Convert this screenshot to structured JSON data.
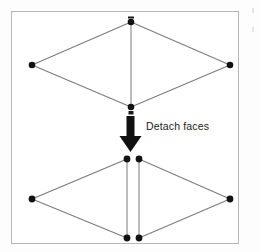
{
  "figure": {
    "background_color": "#ffffff",
    "frame_color": "#b6b6b6",
    "edge_color": "#7d7d7d",
    "vertex_color": "#121212",
    "arrow_color": "#111111",
    "label_color": "#1b1b1b",
    "annotation": {
      "text": "Detach faces",
      "x": 146,
      "y": 120,
      "font_size_px": 10.5
    },
    "arrow": {
      "name": "down-arrow",
      "shaft_x": 130,
      "shaft_top_y": 114,
      "shaft_bottom_y": 134,
      "shaft_width": 7,
      "head_half_width": 11,
      "head_tip_y": 152
    },
    "before": {
      "caption": "Joined mesh: two triangular faces share one interior edge",
      "vertices": [
        {
          "id": "top",
          "name": "vertex-top",
          "x": 131,
          "y": 22
        },
        {
          "id": "left",
          "name": "vertex-left",
          "x": 32,
          "y": 65
        },
        {
          "id": "right",
          "name": "vertex-right",
          "x": 230,
          "y": 65
        },
        {
          "id": "bottom",
          "name": "vertex-bottom",
          "x": 131,
          "y": 107
        }
      ],
      "outline_edges": [
        [
          "top",
          "left"
        ],
        [
          "left",
          "bottom"
        ],
        [
          "bottom",
          "right"
        ],
        [
          "right",
          "top"
        ]
      ],
      "shared_edges": [
        {
          "name": "shared-interior-edge",
          "x1": 131,
          "y1": 22,
          "x2": 131,
          "y2": 107
        }
      ],
      "specks": [
        {
          "name": "speck-above-top-vertex",
          "x": 129,
          "y": 17,
          "w": 6,
          "h": 2
        },
        {
          "name": "speck-below-bottom-vertex",
          "x": 128,
          "y": 111,
          "w": 6,
          "h": 3
        }
      ]
    },
    "after": {
      "caption": "Detached mesh: interior edge split into two coincident edges",
      "vertices": [
        {
          "id": "topLeft",
          "name": "vertex-top-left",
          "x": 127,
          "y": 159
        },
        {
          "id": "topRight",
          "name": "vertex-top-right",
          "x": 139,
          "y": 159
        },
        {
          "id": "left",
          "name": "vertex-left",
          "x": 32,
          "y": 199
        },
        {
          "id": "right",
          "name": "vertex-right",
          "x": 230,
          "y": 199
        },
        {
          "id": "bottomLeft",
          "name": "vertex-bottom-left",
          "x": 127,
          "y": 238
        },
        {
          "id": "bottomRight",
          "name": "vertex-bottom-right",
          "x": 139,
          "y": 238
        }
      ],
      "outline_edges": [
        [
          "topLeft",
          "left"
        ],
        [
          "left",
          "bottomLeft"
        ],
        [
          "bottomRight",
          "right"
        ],
        [
          "right",
          "topRight"
        ]
      ],
      "split_edges": [
        {
          "name": "split-edge-left",
          "x1": 127,
          "y1": 159,
          "x2": 127,
          "y2": 238
        },
        {
          "name": "split-edge-right",
          "x1": 139,
          "y1": 159,
          "x2": 139,
          "y2": 238
        }
      ]
    }
  }
}
